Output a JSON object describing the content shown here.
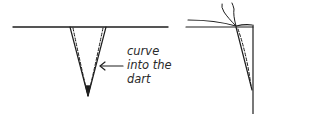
{
  "diagram": {
    "colors": {
      "stroke": "#1e1e1e",
      "text": "#2a2a2a",
      "background": "#ffffff"
    },
    "annotation": {
      "lines": [
        "curve",
        "into the",
        "dart"
      ],
      "arrow": "left-arrow"
    },
    "figures": [
      {
        "name": "dart-flat-view",
        "description": "fabric edge with V-shaped dart, dashed stitching curving into dart"
      },
      {
        "name": "dart-folded-view",
        "description": "dart folded to side, threads tied at point, seam line curving"
      }
    ]
  }
}
